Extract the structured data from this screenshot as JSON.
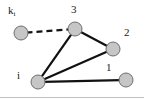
{
  "figure": {
    "title": "",
    "width": 144,
    "height": 99,
    "background_color": "#ffffff",
    "border": {
      "bottom_line_color": "#c0c0c0",
      "visible": true
    }
  },
  "style": {
    "node_fill": "#c6c6c6",
    "node_stroke": "#6e6e6e",
    "node_radius": 7,
    "edge_color": "#111111",
    "edge_width": 2.2,
    "dashed_edge_color": "#111111",
    "dashed_edge_width": 2.2,
    "dash_pattern": "6,4",
    "label_color": "#1a1a1a"
  },
  "graph": {
    "nodes": [
      {
        "id": "ki",
        "label": "k",
        "sublabel": "i",
        "cx": 21,
        "cy": 33,
        "label_x": 8,
        "label_y": 5
      },
      {
        "id": "n3",
        "label": "3",
        "sublabel": "",
        "cx": 75,
        "cy": 29,
        "label_x": 71,
        "label_y": 4
      },
      {
        "id": "n2",
        "label": "2",
        "sublabel": "",
        "cx": 113,
        "cy": 49,
        "label_x": 124,
        "label_y": 27
      },
      {
        "id": "n1",
        "label": "1",
        "sublabel": "",
        "cx": 126,
        "cy": 80,
        "label_x": 106,
        "label_y": 62
      },
      {
        "id": "ni",
        "label": "i",
        "sublabel": "",
        "cx": 38,
        "cy": 82,
        "label_x": 17,
        "label_y": 70
      }
    ],
    "edges": [
      {
        "from": "ki",
        "to": "n3",
        "style": "dashed"
      },
      {
        "from": "n3",
        "to": "n2",
        "style": "solid"
      },
      {
        "from": "ni",
        "to": "n3",
        "style": "solid"
      },
      {
        "from": "ni",
        "to": "n2",
        "style": "solid"
      },
      {
        "from": "ni",
        "to": "n1",
        "style": "solid"
      }
    ]
  }
}
